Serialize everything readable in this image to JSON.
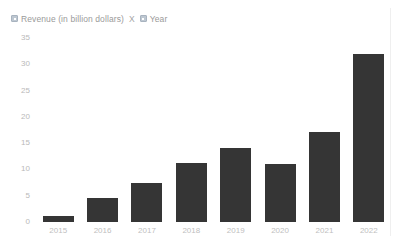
{
  "legend": {
    "entries": [
      {
        "icon": "square-swatch-icon",
        "label": "Revenue (in billion dollars)"
      },
      {
        "icon": "square-swatch-icon",
        "label": "Year"
      }
    ],
    "separator": "X"
  },
  "colors": {
    "bar": "#353535",
    "axis_text": "#bdbdbd",
    "legend_text": "#9a9a9a",
    "legend_swatch": "#bdc7d1",
    "background": "#ffffff",
    "plot_rule": "#efefef"
  },
  "chart_data": {
    "type": "bar",
    "title": "",
    "subtitle": "",
    "xlabel": "Year",
    "ylabel": "Revenue (in billion dollars)",
    "categories": [
      "2015",
      "2016",
      "2017",
      "2018",
      "2019",
      "2020",
      "2021",
      "2022"
    ],
    "values": [
      1.1,
      4.6,
      7.5,
      11.2,
      14,
      11,
      17.2,
      32
    ],
    "series": [
      {
        "name": "Revenue (in billion dollars)",
        "values": [
          1.1,
          4.6,
          7.5,
          11.2,
          14,
          11,
          17.2,
          32
        ]
      }
    ],
    "ylim": [
      0,
      35
    ],
    "ytick_values": [
      0,
      5,
      10,
      15,
      20,
      25,
      30,
      35
    ],
    "ytick_labels": [
      "0",
      "5",
      "10",
      "15",
      "20",
      "25",
      "30",
      "35"
    ],
    "xtick_labels": [
      "2015",
      "2016",
      "2017",
      "2018",
      "2019",
      "2020",
      "2021",
      "2022"
    ],
    "grid": false,
    "legend_position": "top-left",
    "annotations": []
  }
}
